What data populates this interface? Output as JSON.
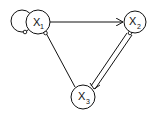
{
  "diagram": {
    "type": "directed-graph",
    "nodes": [
      {
        "id": "x1",
        "label": "X",
        "subscript": "1"
      },
      {
        "id": "x2",
        "label": "X",
        "subscript": "2"
      },
      {
        "id": "x3",
        "label": "X",
        "subscript": "3"
      }
    ],
    "edges": [
      {
        "from": "x1",
        "to": "x1",
        "kind": "self-loop",
        "tail": "small-circle"
      },
      {
        "from": "x1",
        "to": "x2",
        "kind": "arrow",
        "tail": "none"
      },
      {
        "from": "x1",
        "to": "x3",
        "kind": "line",
        "tail": "small-circle"
      },
      {
        "from": "x2",
        "to": "x3",
        "kind": "double-line-arrow",
        "tail": "small-circle"
      }
    ],
    "colors": {
      "stroke": "#111111",
      "background": "#ffffff"
    }
  }
}
